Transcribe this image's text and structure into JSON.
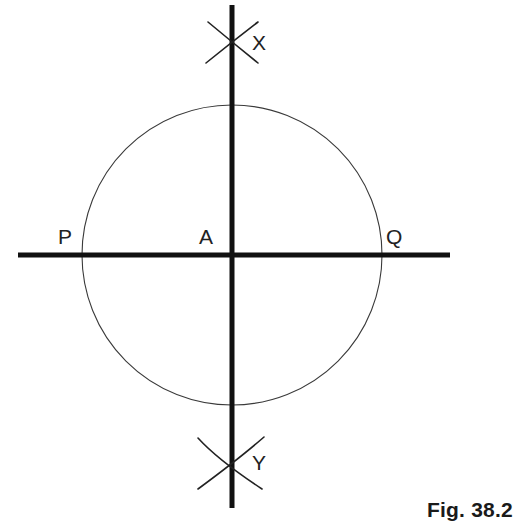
{
  "figure": {
    "caption": "Fig. 38.2",
    "partial_glyph_top_left": "g",
    "background_color": "#ffffff",
    "line_color": "#111111",
    "thin_stroke_color": "#3a3a3a",
    "label_color": "#222222",
    "width": 524,
    "height": 531
  },
  "labels": {
    "center": "A",
    "left_intersection": "P",
    "right_intersection": "Q",
    "top_arc_cross": "X",
    "bottom_arc_cross": "Y"
  },
  "chart_data": {
    "type": "diagram",
    "title": "Fig. 38.2",
    "canvas": {
      "width": 524,
      "height": 531
    },
    "circle": {
      "name": "main-circle",
      "center_x": 232,
      "center_y": 255,
      "radius": 150,
      "stroke_width": 1.1,
      "stroke_color": "#3a3a3a",
      "fill": "none"
    },
    "lines": [
      {
        "name": "horizontal-line-PQ",
        "x1": 18,
        "y1": 255,
        "x2": 450,
        "y2": 255,
        "stroke_width": 5,
        "stroke_color": "#111111"
      },
      {
        "name": "vertical-line-XY",
        "x1": 232,
        "y1": 5,
        "x2": 232,
        "y2": 508,
        "stroke_width": 5,
        "stroke_color": "#111111"
      }
    ],
    "construction_arcs": [
      {
        "name": "top-arc-left-center",
        "path": "M 208 22 Q 232 42 258 63",
        "stroke_width": 1.6,
        "stroke_color": "#222222"
      },
      {
        "name": "top-arc-right-center",
        "path": "M 258 22 Q 232 42 206 63",
        "stroke_width": 1.6,
        "stroke_color": "#222222"
      },
      {
        "name": "bottom-arc-left-center",
        "path": "M 198 438 Q 218 460 262 489",
        "stroke_width": 1.6,
        "stroke_color": "#222222"
      },
      {
        "name": "bottom-arc-right-center",
        "path": "M 264 437 Q 240 458 198 489",
        "stroke_width": 1.6,
        "stroke_color": "#222222"
      }
    ],
    "points": [
      {
        "name": "A",
        "label": "A",
        "x": 232,
        "y": 255,
        "role": "circle-centre"
      },
      {
        "name": "P",
        "label": "P",
        "x": 82,
        "y": 255,
        "role": "left-intersection"
      },
      {
        "name": "Q",
        "label": "Q",
        "x": 382,
        "y": 255,
        "role": "right-intersection"
      },
      {
        "name": "X",
        "label": "X",
        "x": 232,
        "y": 42,
        "role": "upper-arc-crossing"
      },
      {
        "name": "Y",
        "label": "Y",
        "x": 232,
        "y": 465,
        "role": "lower-arc-crossing"
      }
    ],
    "grid": false,
    "legend": false
  }
}
